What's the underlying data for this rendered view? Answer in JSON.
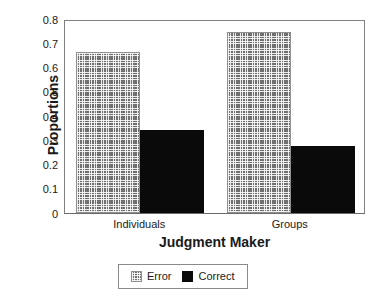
{
  "chart_data": {
    "type": "bar",
    "title": "",
    "xlabel": "Judgment Maker",
    "ylabel": "Proportions",
    "categories": [
      "Individuals",
      "Groups"
    ],
    "series": [
      {
        "name": "Error",
        "values": [
          0.665,
          0.745
        ],
        "color": "#6f6f6f",
        "fill": "cross-hatch"
      },
      {
        "name": "Correct",
        "values": [
          0.342,
          0.277
        ],
        "color": "#0a0a0a",
        "fill": "solid"
      }
    ],
    "ylim": [
      0,
      0.8
    ],
    "ytick_labels": [
      "0.8",
      "0.7",
      "0.6",
      "0.5",
      "0.4",
      "0.3",
      "0.2",
      "0.1",
      "0"
    ],
    "ytick_values": [
      0.8,
      0.7,
      0.6,
      0.5,
      0.4,
      0.3,
      0.2,
      0.1,
      0
    ],
    "grid": false,
    "legend_position": "below-center",
    "legend_entries": [
      "Error",
      "Correct"
    ],
    "frame": "left-top-right-bottom"
  },
  "axes": {
    "y_title": "Proportions",
    "x_title": "Judgment Maker"
  },
  "legend": {
    "entries": [
      {
        "label": "Error"
      },
      {
        "label": "Correct"
      }
    ]
  }
}
